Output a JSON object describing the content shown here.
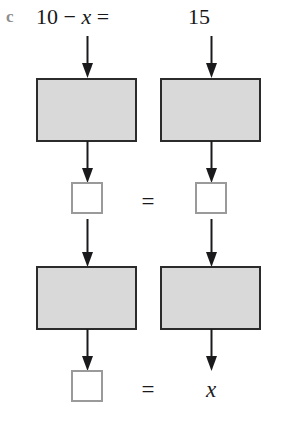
{
  "figure": {
    "part_label": "c",
    "equation": {
      "lhs": "10 − x =",
      "rhs": "15"
    },
    "colors": {
      "box_fill": "#d9d9d9",
      "box_stroke": "#2b2b2b",
      "answer_box_stroke": "#9a9a9a",
      "arrow": "#1a1a1c",
      "text": "#18181a",
      "part_label": "#8d8d8d",
      "background": "#ffffff"
    },
    "columns": [
      {
        "name": "left",
        "operation_box_1": "",
        "answer_box_1": "",
        "operation_box_2": "",
        "answer_box_2": ""
      },
      {
        "name": "right",
        "operation_box_1": "",
        "answer_box_1": "",
        "operation_box_2": "",
        "answer_box_2": ""
      }
    ],
    "relations": {
      "middle_equals": "=",
      "bottom_equals": "=",
      "bottom_right_value": "x"
    },
    "arrow_icons": {
      "down": "arrow-down-icon"
    }
  }
}
